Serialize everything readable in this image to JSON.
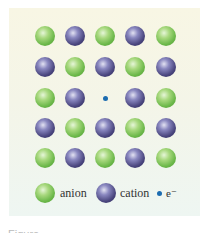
{
  "figure": {
    "grid": [
      [
        "anion",
        "cation",
        "anion",
        "cation",
        "anion"
      ],
      [
        "cation",
        "anion",
        "cation",
        "anion",
        "cation"
      ],
      [
        "anion",
        "cation",
        "electron",
        "cation",
        "anion"
      ],
      [
        "cation",
        "anion",
        "cation",
        "anion",
        "cation"
      ],
      [
        "anion",
        "cation",
        "anion",
        "cation",
        "anion"
      ]
    ],
    "colors": {
      "anion": "#6cb84a",
      "cation": "#4a467e",
      "electron": "#1c6cb0",
      "background": "#f6f5e6"
    }
  },
  "legend": {
    "anion_label": "anion",
    "cation_label": "cation",
    "electron_label": "e⁻"
  },
  "caption": "Figure"
}
